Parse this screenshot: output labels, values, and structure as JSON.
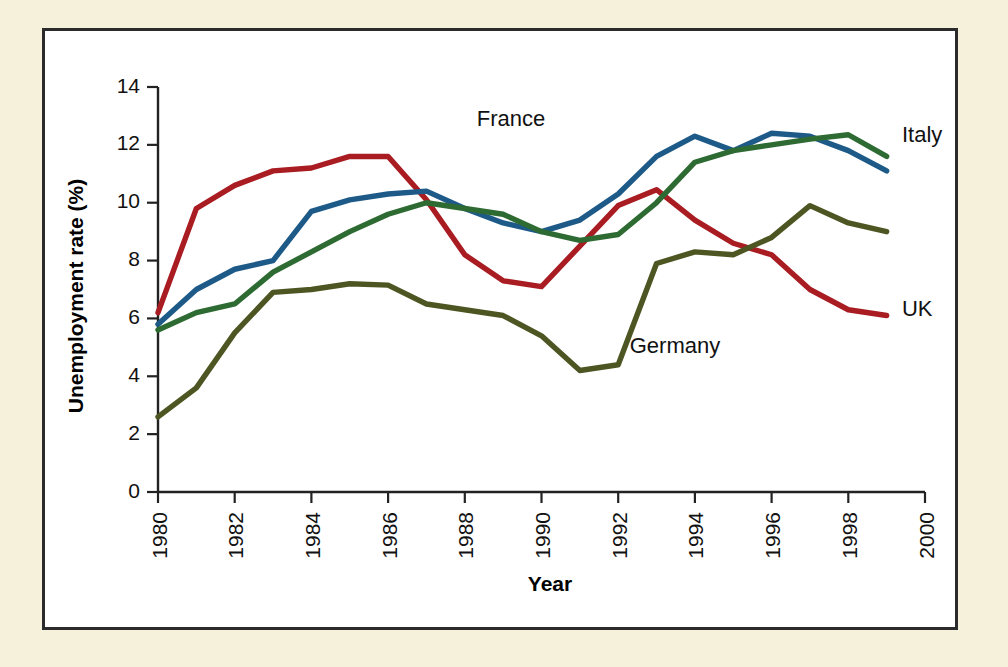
{
  "figure": {
    "background_color": "#f6f1da",
    "panel_color": "#ffffff",
    "border_color": "#2b2b2b"
  },
  "chart_data": {
    "type": "line",
    "title": "",
    "xlabel": "Year",
    "ylabel": "Unemployment rate (%)",
    "xlim": [
      1980,
      2000
    ],
    "ylim": [
      0,
      14
    ],
    "xticks": [
      1980,
      1982,
      1984,
      1986,
      1988,
      1990,
      1992,
      1994,
      1996,
      1998,
      2000
    ],
    "xtick_labels": [
      "1980",
      "1982",
      "1984",
      "1986",
      "1988",
      "1990",
      "1992",
      "1994",
      "1996",
      "1998",
      "2000"
    ],
    "xtick_rotation": 90,
    "yticks": [
      0,
      2,
      4,
      6,
      8,
      10,
      12,
      14
    ],
    "ytick_labels": [
      "0",
      "2",
      "4",
      "6",
      "8",
      "10",
      "12",
      "14"
    ],
    "grid": false,
    "legend_position": "inline-labels",
    "x": [
      1980,
      1981,
      1982,
      1983,
      1984,
      1985,
      1986,
      1987,
      1988,
      1989,
      1990,
      1991,
      1992,
      1993,
      1994,
      1995,
      1996,
      1997,
      1998,
      1999
    ],
    "series": [
      {
        "name": "UK",
        "color": "#a81c22",
        "label_x": 1999.4,
        "label_y": 6.3,
        "values": [
          6.2,
          9.8,
          10.6,
          11.1,
          11.2,
          11.6,
          11.6,
          10.1,
          8.2,
          7.3,
          7.1,
          8.5,
          9.9,
          10.45,
          9.4,
          8.6,
          8.2,
          7.0,
          6.3,
          6.1
        ]
      },
      {
        "name": "France",
        "color": "#1d5a88",
        "label_x": 1990.1,
        "label_y": 12.85,
        "values": [
          5.8,
          7.0,
          7.7,
          8.0,
          9.7,
          10.1,
          10.3,
          10.4,
          9.8,
          9.3,
          9.0,
          9.4,
          10.3,
          11.6,
          12.3,
          11.8,
          12.4,
          12.3,
          11.8,
          11.1
        ]
      },
      {
        "name": "Italy",
        "color": "#2e6b33",
        "label_x": 1999.4,
        "label_y": 12.3,
        "values": [
          5.6,
          6.2,
          6.5,
          7.6,
          8.3,
          9.0,
          9.6,
          10.0,
          9.8,
          9.6,
          9.0,
          8.7,
          8.9,
          10.0,
          11.4,
          11.8,
          12.0,
          12.2,
          12.35,
          11.6
        ]
      },
      {
        "name": "Germany",
        "color": "#4d5622",
        "label_x": 1992.3,
        "label_y": 5.0,
        "values": [
          2.6,
          3.6,
          5.5,
          6.9,
          7.0,
          7.2,
          7.15,
          6.5,
          6.3,
          6.1,
          5.4,
          4.2,
          4.4,
          7.9,
          8.3,
          8.2,
          8.8,
          9.9,
          9.3,
          9.0
        ]
      }
    ]
  }
}
